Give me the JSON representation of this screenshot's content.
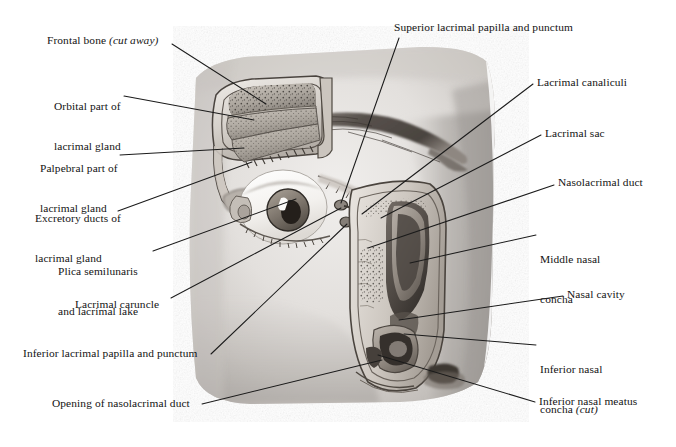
{
  "figure": {
    "type": "anatomical-illustration",
    "width": 676,
    "height": 447,
    "background_color": "#ffffff",
    "line_color": "#1b1b1b",
    "text_color": "#131313"
  },
  "labels": {
    "superior_lacrimal_papilla": "Superior lacrimal papilla and punctum",
    "frontal_bone_main": "Frontal bone ",
    "frontal_bone_italic": "(cut away)",
    "orbital_part_l1": "Orbital part of",
    "orbital_part_l2": "lacrimal gland",
    "palpebral_part_l1": "Palpebral part of",
    "palpebral_part_l2": "lacrimal gland",
    "excretory_ducts_l1": "Excretory ducts of",
    "excretory_ducts_l2": "lacrimal gland",
    "plica_semilunaris_l1": "Plica semilunaris",
    "plica_semilunaris_l2": "and lacrimal lake",
    "lacrimal_caruncle": "Lacrimal caruncle",
    "inferior_lacrimal_papilla": "Inferior lacrimal papilla and punctum",
    "opening_nasolacrimal_duct": "Opening of nasolacrimal duct",
    "lacrimal_canaliculi": "Lacrimal canaliculi",
    "lacrimal_sac": "Lacrimal sac",
    "nasolacrimal_duct": "Nasolacrimal duct",
    "middle_nasal_concha_l1": "Middle nasal",
    "middle_nasal_concha_l2": "concha",
    "nasal_cavity": "Nasal cavity",
    "inferior_nasal_concha_l1": "Inferior nasal",
    "inferior_nasal_concha_l2_main": "concha ",
    "inferior_nasal_concha_l2_italic": "(cut)",
    "inferior_nasal_meatus": "Inferior nasal meatus"
  },
  "structures": [
    {
      "name": "frontal-bone",
      "note": "cut away, superior orbital roof"
    },
    {
      "name": "orbital-part-lacrimal-gland"
    },
    {
      "name": "palpebral-part-lacrimal-gland"
    },
    {
      "name": "excretory-ducts-lacrimal-gland"
    },
    {
      "name": "eyeball"
    },
    {
      "name": "eyebrow"
    },
    {
      "name": "superior-lacrimal-papilla-punctum"
    },
    {
      "name": "inferior-lacrimal-papilla-punctum"
    },
    {
      "name": "plica-semilunaris-lacrimal-lake"
    },
    {
      "name": "lacrimal-caruncle"
    },
    {
      "name": "lacrimal-canaliculi"
    },
    {
      "name": "lacrimal-sac"
    },
    {
      "name": "nasolacrimal-duct"
    },
    {
      "name": "opening-of-nasolacrimal-duct"
    },
    {
      "name": "middle-nasal-concha"
    },
    {
      "name": "nasal-cavity"
    },
    {
      "name": "inferior-nasal-concha-cut"
    },
    {
      "name": "inferior-nasal-meatus"
    },
    {
      "name": "nostril"
    }
  ]
}
